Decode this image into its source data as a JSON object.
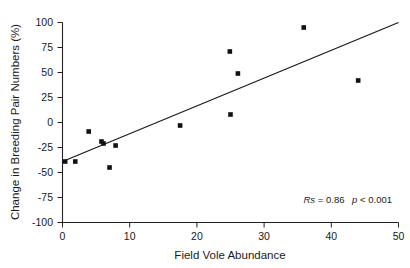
{
  "chart_data": {
    "type": "scatter",
    "title": "",
    "xlabel": "Field Vole Abundance",
    "ylabel": "Change in Breeding Pair Numbers (%)",
    "xlim": [
      0,
      50
    ],
    "ylim": [
      -100,
      100
    ],
    "xticks": [
      0,
      10,
      20,
      30,
      40,
      50
    ],
    "yticks": [
      100,
      75,
      50,
      25,
      0,
      -25,
      -50,
      -75,
      -100
    ],
    "xticklabels": [
      "0",
      "10",
      "20",
      "30",
      "40",
      "50"
    ],
    "yticklabels": [
      "100",
      "75",
      "50",
      "25",
      "0",
      "-25",
      "-50",
      "-75",
      "-100"
    ],
    "grid": false,
    "legend": null,
    "points": [
      {
        "x": 0.4,
        "y": -39
      },
      {
        "x": 1.9,
        "y": -39
      },
      {
        "x": 3.9,
        "y": -9
      },
      {
        "x": 5.8,
        "y": -19
      },
      {
        "x": 6.1,
        "y": -21
      },
      {
        "x": 7.0,
        "y": -45
      },
      {
        "x": 7.9,
        "y": -23
      },
      {
        "x": 17.5,
        "y": -3
      },
      {
        "x": 24.9,
        "y": 71
      },
      {
        "x": 25.0,
        "y": 8
      },
      {
        "x": 26.1,
        "y": 49
      },
      {
        "x": 35.9,
        "y": 95
      },
      {
        "x": 44.0,
        "y": 42
      }
    ],
    "series": [
      {
        "name": "Observations",
        "marker": "square",
        "color": "#111111",
        "x": [
          0.4,
          1.9,
          3.9,
          5.8,
          6.1,
          7.0,
          7.9,
          17.5,
          24.9,
          25.0,
          26.1,
          35.9,
          44.0
        ],
        "y": [
          -39,
          -39,
          -9,
          -19,
          -21,
          -45,
          -23,
          -3,
          71,
          8,
          49,
          95,
          42
        ]
      }
    ],
    "trendline": {
      "name": "linear fit",
      "x0": 0,
      "y0": -39,
      "x1": 50,
      "y1": 100,
      "color": "#1a1a1a"
    },
    "annotations": [
      {
        "name": "correlation-statistics",
        "text": "Rs = 0.86  p < 0.001",
        "parts": {
          "stat_symbol": "Rs",
          "equals": " = ",
          "stat_value": "0.86",
          "p_symbol": "p",
          "p_value": " < 0.001"
        },
        "x": 50,
        "y": -78
      }
    ]
  },
  "axes": {
    "x_title": "Field Vole Abundance",
    "y_title": "Change in Breeding Pair Numbers (%)"
  }
}
